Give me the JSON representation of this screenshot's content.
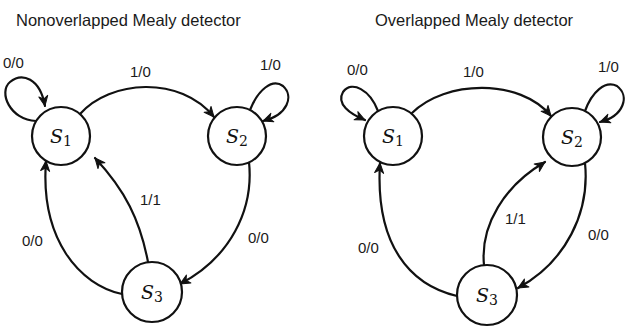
{
  "diagrams": [
    {
      "title": "Nonoverlapped Mealy detector",
      "title_pos": [
        16,
        26
      ],
      "states": [
        {
          "id": "S1",
          "name": "S",
          "sub": "1",
          "cx": 61,
          "cy": 136,
          "r": 29
        },
        {
          "id": "S2",
          "name": "S",
          "sub": "2",
          "cx": 237,
          "cy": 136,
          "r": 29
        },
        {
          "id": "S3",
          "name": "S",
          "sub": "3",
          "cx": 152,
          "cy": 292,
          "r": 30
        }
      ],
      "transitions": [
        {
          "from": "S1",
          "to": "S1",
          "label": "0/0",
          "path": "M 36 121 C 10 120, -2 92, 10 82 C 22 72, 40 78, 45 106",
          "arrow": [
            45,
            106,
            80
          ],
          "label_pos": [
            3,
            68
          ]
        },
        {
          "from": "S1",
          "to": "S2",
          "label": "1/0",
          "path": "M 80 114 C 110 80, 180 75, 214 117",
          "arrow": [
            214,
            117,
            50
          ],
          "label_pos": [
            130,
            77
          ]
        },
        {
          "from": "S2",
          "to": "S2",
          "label": "1/0",
          "path": "M 250 110 C 258 90, 272 78, 283 86 C 294 96, 288 115, 263 121",
          "arrow": [
            263,
            121,
            160
          ],
          "label_pos": [
            260,
            70
          ]
        },
        {
          "from": "S2",
          "to": "S3",
          "label": "0/0",
          "path": "M 249 162 C 254 210, 230 258, 180 284",
          "arrow": [
            180,
            284,
            150
          ],
          "label_pos": [
            248,
            243
          ]
        },
        {
          "from": "S3",
          "to": "S1",
          "label": "0/0",
          "path": "M 122 294 C 80 285, 40 240, 46 161",
          "arrow": [
            46,
            161,
            -85
          ],
          "label_pos": [
            22,
            246
          ]
        },
        {
          "from": "S3",
          "to": "S1",
          "label": "1/1",
          "path": "M 148 262 C 140 220, 125 190, 95 158",
          "arrow": [
            95,
            158,
            -130
          ],
          "label_pos": [
            140,
            205
          ]
        }
      ]
    },
    {
      "title": "Overlapped Mealy detector",
      "title_pos": [
        375,
        26
      ],
      "states": [
        {
          "id": "S1",
          "name": "S",
          "sub": "1",
          "cx": 393,
          "cy": 136,
          "r": 29
        },
        {
          "id": "S2",
          "name": "S",
          "sub": "2",
          "cx": 572,
          "cy": 137,
          "r": 29
        },
        {
          "id": "S3",
          "name": "S",
          "sub": "3",
          "cx": 487,
          "cy": 295,
          "r": 30
        }
      ],
      "transitions": [
        {
          "from": "S1",
          "to": "S1",
          "label": "0/0",
          "path": "M 378 111 C 370 90, 352 80, 343 92 C 336 104, 350 114, 365 120",
          "arrow": [
            365,
            120,
            25
          ],
          "label_pos": [
            347,
            75
          ]
        },
        {
          "from": "S1",
          "to": "S2",
          "label": "1/0",
          "path": "M 412 113 C 445 80, 520 78, 551 116",
          "arrow": [
            551,
            116,
            50
          ],
          "label_pos": [
            463,
            77
          ]
        },
        {
          "from": "S2",
          "to": "S2",
          "label": "1/0",
          "path": "M 585 111 C 592 92, 605 80, 617 86 C 630 96, 624 116, 600 122",
          "arrow": [
            600,
            122,
            160
          ],
          "label_pos": [
            598,
            72
          ]
        },
        {
          "from": "S2",
          "to": "S3",
          "label": "0/0",
          "path": "M 585 163 C 590 212, 566 262, 518 288",
          "arrow": [
            518,
            288,
            150
          ],
          "label_pos": [
            588,
            240
          ]
        },
        {
          "from": "S3",
          "to": "S1",
          "label": "0/0",
          "path": "M 457 296 C 410 285, 375 245, 380 163",
          "arrow": [
            380,
            163,
            -85
          ],
          "label_pos": [
            358,
            253
          ]
        },
        {
          "from": "S3",
          "to": "S2",
          "label": "1/1",
          "path": "M 484 265 C 480 225, 505 185, 545 162",
          "arrow": [
            545,
            162,
            -35
          ],
          "label_pos": [
            505,
            224
          ]
        }
      ]
    }
  ]
}
